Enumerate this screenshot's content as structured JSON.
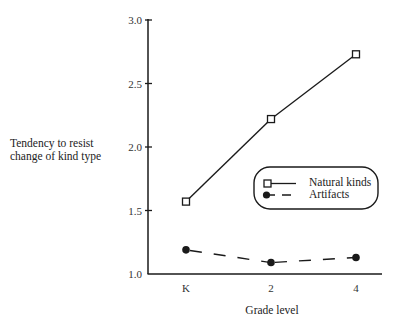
{
  "chart_data": {
    "type": "line",
    "title": "",
    "xlabel": "Grade level",
    "ylabel": [
      "Tendency to resist",
      "change of kind type"
    ],
    "categories": [
      "K",
      "2",
      "4"
    ],
    "ylim": [
      1.0,
      3.0
    ],
    "yticks": [
      "1.0",
      "1.5",
      "2.0",
      "2.5",
      "3.0"
    ],
    "grid": false,
    "legend_position": "right-middle (rounded box)",
    "series": [
      {
        "name": "Natural kinds",
        "marker": "open-square",
        "line": "solid",
        "values": [
          1.57,
          2.22,
          2.73
        ]
      },
      {
        "name": "Artifacts",
        "marker": "filled-circle",
        "line": "dashed",
        "values": [
          1.19,
          1.09,
          1.13
        ]
      }
    ]
  },
  "colors": {
    "line": "#1a1a1a",
    "axis": "#1a1a1a",
    "background": "#ffffff"
  }
}
